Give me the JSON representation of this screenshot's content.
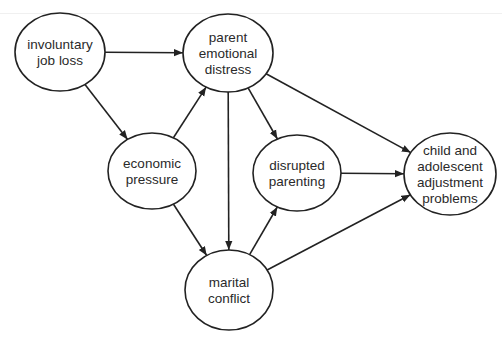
{
  "diagram": {
    "type": "path-model",
    "nodes": [
      {
        "id": "job_loss",
        "lines": [
          "involuntary",
          "job loss"
        ],
        "cx": 60,
        "cy": 52,
        "rx": 45,
        "ry": 39
      },
      {
        "id": "distress",
        "lines": [
          "parent",
          "emotional",
          "distress"
        ],
        "cx": 228,
        "cy": 53,
        "rx": 45,
        "ry": 39
      },
      {
        "id": "economic",
        "lines": [
          "economic",
          "pressure"
        ],
        "cx": 152,
        "cy": 171,
        "rx": 44,
        "ry": 38
      },
      {
        "id": "parenting",
        "lines": [
          "disrupted",
          "parenting"
        ],
        "cx": 297,
        "cy": 173,
        "rx": 44,
        "ry": 38
      },
      {
        "id": "child",
        "lines": [
          "child and",
          "adolescent",
          "adjustment",
          "problems"
        ],
        "cx": 450,
        "cy": 174,
        "rx": 46,
        "ry": 41
      },
      {
        "id": "marital",
        "lines": [
          "marital",
          "conflict"
        ],
        "cx": 229,
        "cy": 290,
        "rx": 44,
        "ry": 40
      }
    ],
    "edges": [
      {
        "from": "job_loss",
        "to": "distress"
      },
      {
        "from": "job_loss",
        "to": "economic"
      },
      {
        "from": "economic",
        "to": "distress"
      },
      {
        "from": "economic",
        "to": "marital"
      },
      {
        "from": "distress",
        "to": "marital"
      },
      {
        "from": "distress",
        "to": "parenting"
      },
      {
        "from": "distress",
        "to": "child"
      },
      {
        "from": "marital",
        "to": "parenting"
      },
      {
        "from": "parenting",
        "to": "child"
      },
      {
        "from": "marital",
        "to": "child"
      }
    ]
  }
}
